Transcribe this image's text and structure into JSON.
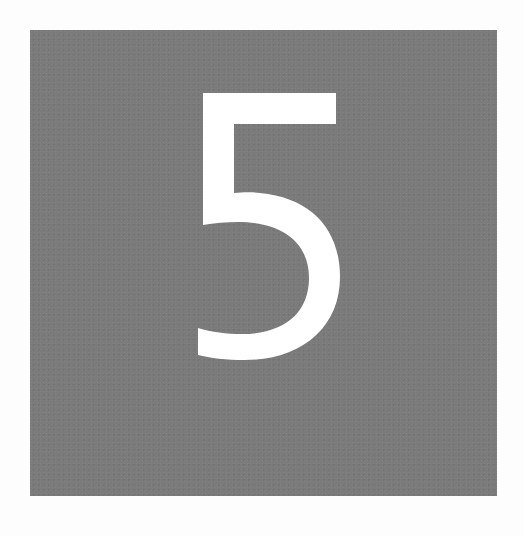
{
  "tile": {
    "digit": "5",
    "background_color": "#7b7b7b",
    "digit_color": "#ffffff",
    "page_background": "#fdfdfd"
  }
}
